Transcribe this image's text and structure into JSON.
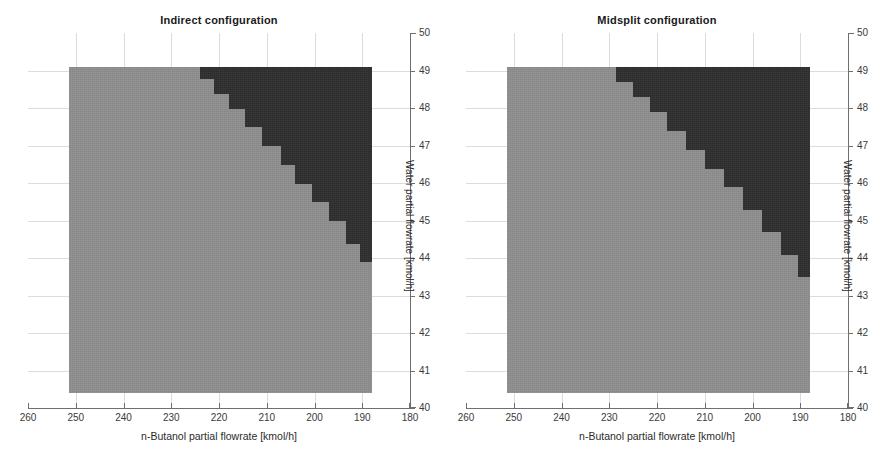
{
  "figure": {
    "background": "#ffffff",
    "colors": {
      "light_region": "#8f8f8f",
      "dark_region": "#2e2e2e",
      "grid": "#d8dde4",
      "axis": "#6f6f6f"
    }
  },
  "chart_data": [
    {
      "type": "heatmap",
      "title": "Indirect configuration",
      "xlabel": "n-Butanol partial flowrate [kmol/h]",
      "ylabel": "Water partial flowrate [kmol/h]",
      "xlim": [
        260,
        180
      ],
      "ylim": [
        40,
        50
      ],
      "xticks": [
        260,
        250,
        240,
        230,
        220,
        210,
        200,
        190,
        180
      ],
      "yticks": [
        40,
        41,
        42,
        43,
        44,
        45,
        46,
        47,
        48,
        49,
        50
      ],
      "x_axis_reversed": true,
      "grid": true,
      "legend": "none",
      "data_extent": {
        "x_from": 251.5,
        "x_to": 188.0,
        "y_from": 40.4,
        "y_to": 49.1
      },
      "categories_z": [
        "light (region A)",
        "dark (region B)"
      ],
      "boundary_note": "Staircase boundary separating light region (left/below) from dark region (upper right).",
      "boundary_steps": [
        {
          "y_top": 49.1,
          "y_bottom": 48.8,
          "x_boundary": 224.0
        },
        {
          "y_top": 48.8,
          "y_bottom": 48.4,
          "x_boundary": 221.0
        },
        {
          "y_top": 48.4,
          "y_bottom": 48.0,
          "x_boundary": 218.0
        },
        {
          "y_top": 48.0,
          "y_bottom": 47.5,
          "x_boundary": 214.5
        },
        {
          "y_top": 47.5,
          "y_bottom": 47.0,
          "x_boundary": 211.0
        },
        {
          "y_top": 47.0,
          "y_bottom": 46.5,
          "x_boundary": 207.0
        },
        {
          "y_top": 46.5,
          "y_bottom": 46.0,
          "x_boundary": 204.0
        },
        {
          "y_top": 46.0,
          "y_bottom": 45.5,
          "x_boundary": 200.5
        },
        {
          "y_top": 45.5,
          "y_bottom": 45.0,
          "x_boundary": 197.0
        },
        {
          "y_top": 45.0,
          "y_bottom": 44.4,
          "x_boundary": 193.5
        },
        {
          "y_top": 44.4,
          "y_bottom": 43.9,
          "x_boundary": 190.5
        }
      ]
    },
    {
      "type": "heatmap",
      "title": "Midsplit configuration",
      "xlabel": "n-Butanol partial flowrate [kmol/h]",
      "ylabel": "Water partial flowrate [kmol/h]",
      "xlim": [
        260,
        180
      ],
      "ylim": [
        40,
        50
      ],
      "xticks": [
        260,
        250,
        240,
        230,
        220,
        210,
        200,
        190,
        180
      ],
      "yticks": [
        40,
        41,
        42,
        43,
        44,
        45,
        46,
        47,
        48,
        49,
        50
      ],
      "x_axis_reversed": true,
      "grid": true,
      "legend": "none",
      "data_extent": {
        "x_from": 251.5,
        "x_to": 188.0,
        "y_from": 40.4,
        "y_to": 49.1
      },
      "categories_z": [
        "light (region A)",
        "dark (region B)"
      ],
      "boundary_note": "Staircase boundary separating light region (left/below) from dark region (upper right).",
      "boundary_steps": [
        {
          "y_top": 49.1,
          "y_bottom": 48.7,
          "x_boundary": 228.5
        },
        {
          "y_top": 48.7,
          "y_bottom": 48.3,
          "x_boundary": 225.0
        },
        {
          "y_top": 48.3,
          "y_bottom": 47.9,
          "x_boundary": 221.5
        },
        {
          "y_top": 47.9,
          "y_bottom": 47.4,
          "x_boundary": 218.0
        },
        {
          "y_top": 47.4,
          "y_bottom": 46.9,
          "x_boundary": 214.0
        },
        {
          "y_top": 46.9,
          "y_bottom": 46.4,
          "x_boundary": 210.0
        },
        {
          "y_top": 46.4,
          "y_bottom": 45.9,
          "x_boundary": 206.0
        },
        {
          "y_top": 45.9,
          "y_bottom": 45.3,
          "x_boundary": 202.0
        },
        {
          "y_top": 45.3,
          "y_bottom": 44.7,
          "x_boundary": 198.0
        },
        {
          "y_top": 44.7,
          "y_bottom": 44.1,
          "x_boundary": 194.0
        },
        {
          "y_top": 44.1,
          "y_bottom": 43.5,
          "x_boundary": 190.5
        }
      ]
    }
  ]
}
